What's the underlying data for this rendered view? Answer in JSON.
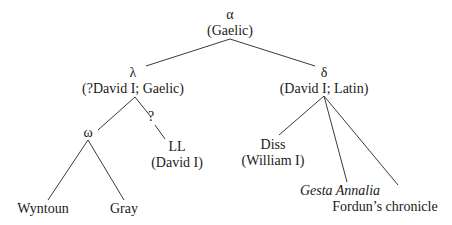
{
  "diagram": {
    "type": "stemma-tree",
    "nodes": {
      "alpha": {
        "symbol": "α",
        "label": "(Gaelic)"
      },
      "lambda": {
        "symbol": "λ",
        "label": "(?David I; Gaelic)"
      },
      "delta": {
        "symbol": "δ",
        "label": "(David I; Latin)"
      },
      "omega": {
        "symbol": "ω"
      },
      "unknown": {
        "symbol": "?"
      },
      "ll": {
        "symbol": "LL",
        "label": "(David I)"
      },
      "diss": {
        "symbol": "Diss",
        "label": "(William I)"
      },
      "wyntoun": {
        "label": "Wyntoun"
      },
      "gray": {
        "label": "Gray"
      },
      "gesta": {
        "label": "Gesta Annalia"
      },
      "fordun": {
        "label": "Fordun’s chronicle"
      }
    },
    "edges": [
      [
        "alpha",
        "lambda"
      ],
      [
        "alpha",
        "delta"
      ],
      [
        "lambda",
        "omega"
      ],
      [
        "lambda",
        "unknown"
      ],
      [
        "unknown",
        "ll"
      ],
      [
        "omega",
        "wyntoun"
      ],
      [
        "omega",
        "gray"
      ],
      [
        "delta",
        "diss"
      ],
      [
        "delta",
        "gesta"
      ],
      [
        "delta",
        "fordun"
      ]
    ]
  }
}
